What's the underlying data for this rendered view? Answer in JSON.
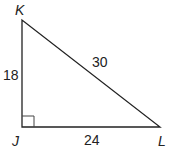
{
  "diagram": {
    "vertices": {
      "K": "K",
      "J": "J",
      "L": "L"
    },
    "sides": {
      "KJ": "18",
      "KL": "30",
      "JL": "24"
    },
    "right_angle_at": "J",
    "line_color": "#222222"
  }
}
